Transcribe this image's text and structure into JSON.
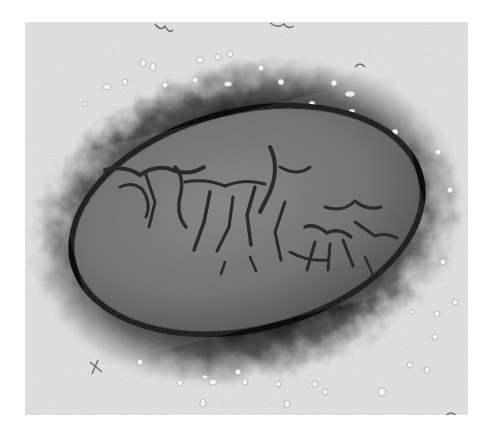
{
  "image": {
    "kind": "electron-micrograph",
    "subject": "oval virus particle with surface ridges",
    "colors": {
      "page_background": "#ffffff",
      "frame_background": "#e6e6e6",
      "halo_dark": "#141414",
      "body_gray": "#7a7a7a",
      "ridge_dark": "#2a2a2a",
      "particle_light": "#f2f2f2"
    }
  }
}
